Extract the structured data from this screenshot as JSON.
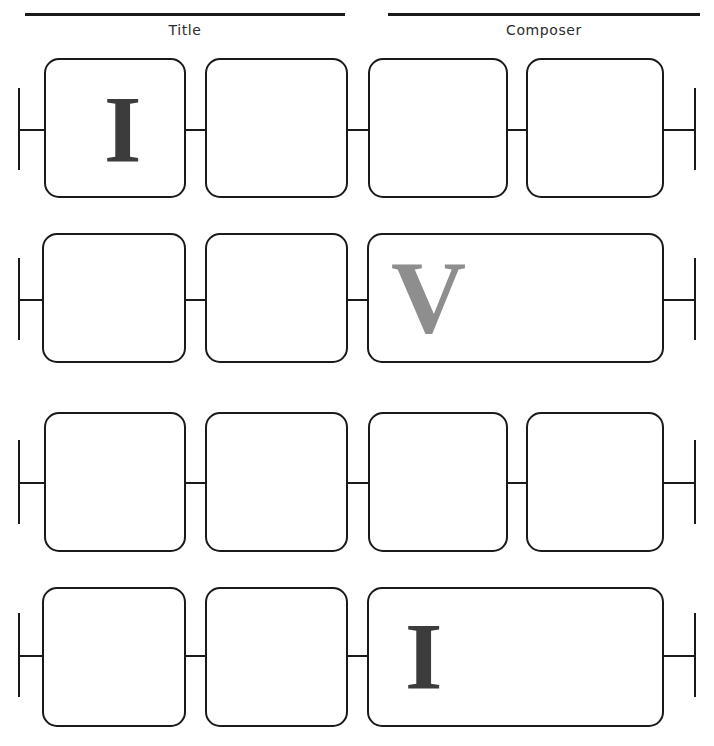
{
  "page": {
    "width": 714,
    "height": 746,
    "background": "#ffffff",
    "ink_color": "#1a1a1a"
  },
  "header": {
    "fields": [
      {
        "name": "title",
        "label": "Title",
        "value": "",
        "rule": {
          "x": 25,
          "y": 13,
          "width": 320
        },
        "label_box": {
          "x": 25,
          "y": 22,
          "width": 320
        }
      },
      {
        "name": "composer",
        "label": "Composer",
        "value": "",
        "rule": {
          "x": 388,
          "y": 13,
          "width": 312
        },
        "label_box": {
          "x": 388,
          "y": 22,
          "width": 312
        }
      }
    ]
  },
  "staff": {
    "row_count": 4,
    "rows": [
      {
        "index": 1,
        "top": 58,
        "height": 140,
        "endcap_left": {
          "x": 18,
          "y": 88,
          "height": 82
        },
        "endcap_right": {
          "x": 694,
          "y": 88,
          "height": 82
        },
        "connectors": [
          {
            "x": 18,
            "y": 129,
            "width": 26
          },
          {
            "x": 186,
            "y": 129,
            "width": 19
          },
          {
            "x": 348,
            "y": 129,
            "width": 20
          },
          {
            "x": 508,
            "y": 129,
            "width": 18
          },
          {
            "x": 664,
            "y": 129,
            "width": 30
          }
        ],
        "cells": [
          {
            "name": "measure-1-1",
            "x": 44,
            "y": 58,
            "width": 142,
            "height": 140,
            "glyph": {
              "text": "I",
              "color": "#3c3c3c",
              "size": 96,
              "x": 60,
              "y": 24
            }
          },
          {
            "name": "measure-1-2",
            "x": 205,
            "y": 58,
            "width": 143,
            "height": 140,
            "glyph": null
          },
          {
            "name": "measure-1-3",
            "x": 368,
            "y": 58,
            "width": 140,
            "height": 140,
            "glyph": null
          },
          {
            "name": "measure-1-4",
            "x": 526,
            "y": 58,
            "width": 138,
            "height": 140,
            "glyph": null
          }
        ]
      },
      {
        "index": 2,
        "top": 233,
        "height": 130,
        "endcap_left": {
          "x": 18,
          "y": 258,
          "height": 82
        },
        "endcap_right": {
          "x": 694,
          "y": 258,
          "height": 82
        },
        "connectors": [
          {
            "x": 18,
            "y": 299,
            "width": 24
          },
          {
            "x": 186,
            "y": 299,
            "width": 19
          },
          {
            "x": 348,
            "y": 299,
            "width": 19
          },
          {
            "x": 664,
            "y": 299,
            "width": 30
          }
        ],
        "cells": [
          {
            "name": "measure-2-1",
            "x": 42,
            "y": 233,
            "width": 144,
            "height": 130,
            "glyph": null
          },
          {
            "name": "measure-2-2",
            "x": 205,
            "y": 233,
            "width": 143,
            "height": 130,
            "glyph": null
          },
          {
            "name": "measure-2-3",
            "x": 367,
            "y": 233,
            "width": 297,
            "height": 130,
            "glyph": {
              "text": "V",
              "color": "#8e8e8e",
              "size": 104,
              "x": 24,
              "y": 12
            }
          }
        ]
      },
      {
        "index": 3,
        "top": 412,
        "height": 140,
        "endcap_left": {
          "x": 18,
          "y": 440,
          "height": 84
        },
        "endcap_right": {
          "x": 694,
          "y": 440,
          "height": 84
        },
        "connectors": [
          {
            "x": 18,
            "y": 482,
            "width": 26
          },
          {
            "x": 186,
            "y": 482,
            "width": 19
          },
          {
            "x": 348,
            "y": 482,
            "width": 20
          },
          {
            "x": 508,
            "y": 482,
            "width": 18
          },
          {
            "x": 664,
            "y": 482,
            "width": 30
          }
        ],
        "cells": [
          {
            "name": "measure-3-1",
            "x": 44,
            "y": 412,
            "width": 142,
            "height": 140,
            "glyph": null
          },
          {
            "name": "measure-3-2",
            "x": 205,
            "y": 412,
            "width": 143,
            "height": 140,
            "glyph": null
          },
          {
            "name": "measure-3-3",
            "x": 368,
            "y": 412,
            "width": 140,
            "height": 140,
            "glyph": null
          },
          {
            "name": "measure-3-4",
            "x": 526,
            "y": 412,
            "width": 138,
            "height": 140,
            "glyph": null
          }
        ]
      },
      {
        "index": 4,
        "top": 587,
        "height": 140,
        "endcap_left": {
          "x": 18,
          "y": 613,
          "height": 84
        },
        "endcap_right": {
          "x": 694,
          "y": 613,
          "height": 84
        },
        "connectors": [
          {
            "x": 18,
            "y": 655,
            "width": 24
          },
          {
            "x": 186,
            "y": 655,
            "width": 19
          },
          {
            "x": 348,
            "y": 655,
            "width": 19
          },
          {
            "x": 664,
            "y": 655,
            "width": 30
          }
        ],
        "cells": [
          {
            "name": "measure-4-1",
            "x": 42,
            "y": 587,
            "width": 144,
            "height": 140,
            "glyph": null
          },
          {
            "name": "measure-4-2",
            "x": 205,
            "y": 587,
            "width": 143,
            "height": 140,
            "glyph": null
          },
          {
            "name": "measure-4-3",
            "x": 367,
            "y": 587,
            "width": 297,
            "height": 140,
            "glyph": {
              "text": "I",
              "color": "#3c3c3c",
              "size": 96,
              "x": 38,
              "y": 22
            }
          }
        ]
      }
    ]
  }
}
